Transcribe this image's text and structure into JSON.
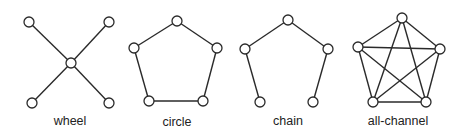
{
  "colors": {
    "stroke": "#2a2a2a",
    "node_fill": "#ffffff",
    "text": "#222222",
    "background": "#ffffff"
  },
  "node_radius": 5,
  "networks": [
    {
      "id": "wheel",
      "label": "wheel",
      "label_pos": [
        70,
        125
      ],
      "nodes": [
        [
          29,
          22
        ],
        [
          109,
          22
        ],
        [
          71,
          63
        ],
        [
          32,
          103
        ],
        [
          109,
          103
        ]
      ],
      "edges": [
        [
          0,
          2
        ],
        [
          1,
          2
        ],
        [
          3,
          2
        ],
        [
          4,
          2
        ]
      ]
    },
    {
      "id": "circle",
      "label": "circle",
      "label_pos": [
        177,
        126
      ],
      "nodes": [
        [
          177,
          21
        ],
        [
          134,
          48
        ],
        [
          217,
          48
        ],
        [
          149,
          101
        ],
        [
          203,
          101
        ]
      ],
      "edges": [
        [
          0,
          1
        ],
        [
          0,
          2
        ],
        [
          1,
          3
        ],
        [
          2,
          4
        ],
        [
          3,
          4
        ]
      ]
    },
    {
      "id": "chain",
      "label": "chain",
      "label_pos": [
        288,
        125
      ],
      "nodes": [
        [
          288,
          20
        ],
        [
          245,
          49
        ],
        [
          328,
          49
        ],
        [
          260,
          102
        ],
        [
          313,
          102
        ]
      ],
      "edges": [
        [
          0,
          1
        ],
        [
          0,
          2
        ],
        [
          1,
          3
        ],
        [
          2,
          4
        ]
      ]
    },
    {
      "id": "all-channel",
      "label": "all-channel",
      "label_pos": [
        398,
        125
      ],
      "nodes": [
        [
          402,
          18
        ],
        [
          358,
          47
        ],
        [
          440,
          49
        ],
        [
          373,
          102
        ],
        [
          426,
          102
        ]
      ],
      "edges": [
        [
          0,
          1
        ],
        [
          0,
          2
        ],
        [
          0,
          3
        ],
        [
          0,
          4
        ],
        [
          1,
          2
        ],
        [
          1,
          3
        ],
        [
          1,
          4
        ],
        [
          2,
          3
        ],
        [
          2,
          4
        ],
        [
          3,
          4
        ]
      ]
    }
  ]
}
